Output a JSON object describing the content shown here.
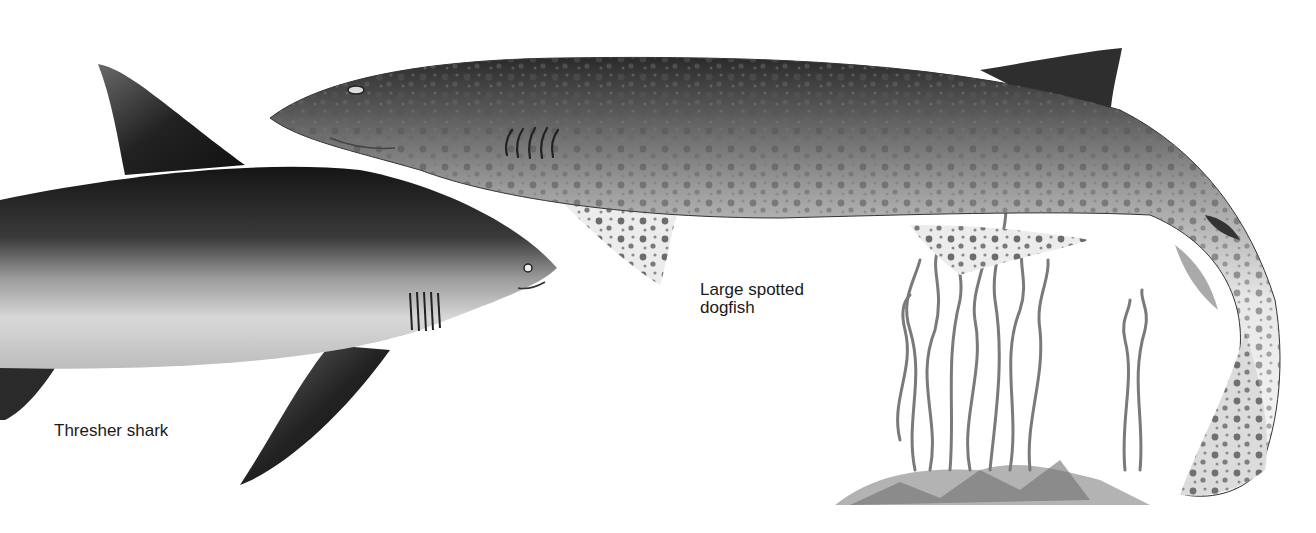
{
  "illustration": {
    "kind": "grayscale natural-history illustration of two sharks",
    "background_color": "#ffffff",
    "subjects": [
      {
        "name": "Large spotted dogfish",
        "description": "spotted slender shark swimming left, tail curving down to seabed"
      },
      {
        "name": "Thresher shark",
        "description": "dark-backed shark swimming right, partly cropped at left edge"
      }
    ],
    "scenery": "seaweed fronds growing from rocky seabed, lower right"
  },
  "labels": {
    "dogfish_line1": "Large spotted",
    "dogfish_line2": "dogfish",
    "thresher": "Thresher shark"
  },
  "colors": {
    "ink": "#1a1a1a",
    "shark_dark": "#222222",
    "shark_mid": "#8a8a8a",
    "belly": "#f0f0f0",
    "spots": "#5a5a5a",
    "weed": "#7a7a7a"
  }
}
